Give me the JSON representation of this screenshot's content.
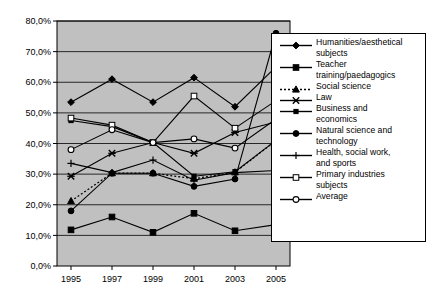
{
  "chart_data": {
    "type": "line",
    "title": "",
    "xlabel": "",
    "ylabel": "",
    "categories": [
      "1995",
      "1997",
      "1999",
      "2001",
      "2003",
      "2005"
    ],
    "x": [
      1995,
      1997,
      1999,
      2001,
      2003,
      2005
    ],
    "ylim": [
      0,
      80
    ],
    "ytick_values": [
      0,
      10,
      20,
      30,
      40,
      50,
      60,
      70,
      80
    ],
    "ytick_labels": [
      "0,0%",
      "10,0%",
      "20,0%",
      "30,0%",
      "40,0%",
      "50,0%",
      "60,0%",
      "70,0%",
      "80,0%"
    ],
    "xtick_labels": [
      "1995",
      "1997",
      "1999",
      "2001",
      "2003",
      "2005"
    ],
    "grid": "horizontal",
    "legend_position": "right",
    "plot_background": "#c0c0c0",
    "line_color": "#000000",
    "series": [
      {
        "name": "Humanities/aesthetical subjects",
        "marker": "diamond-filled",
        "dash": "solid",
        "values": [
          53.5,
          61.0,
          53.5,
          61.5,
          52.0,
          65.0
        ]
      },
      {
        "name": "Teacher training/paedagogics",
        "marker": "square-filled",
        "dash": "solid",
        "values": [
          11.8,
          16.0,
          11.0,
          17.2,
          11.5,
          13.5
        ]
      },
      {
        "name": "Social science",
        "marker": "triangle-filled",
        "dash": "dotted",
        "values": [
          21.2,
          30.3,
          30.3,
          28.5,
          30.6,
          41.0
        ]
      },
      {
        "name": "Law",
        "marker": "x-cross",
        "dash": "solid",
        "values": [
          29.3,
          36.8,
          40.3,
          36.8,
          43.6,
          47.0
        ]
      },
      {
        "name": "Business and economics",
        "marker": "square-small-filled",
        "dash": "solid",
        "values": [
          47.5,
          45.5,
          40.3,
          29.3,
          30.8,
          41.0
        ]
      },
      {
        "name": "Natural science and technology",
        "marker": "circle-filled",
        "dash": "solid",
        "values": [
          18.0,
          30.3,
          30.3,
          26.0,
          28.4,
          76.0
        ]
      },
      {
        "name": "Health, social work, and sports",
        "marker": "plus",
        "dash": "solid",
        "values": [
          33.5,
          30.5,
          34.6,
          28.0,
          30.5,
          31.2
        ]
      },
      {
        "name": "Primary industries subjects",
        "marker": "square-open",
        "dash": "solid",
        "values": [
          48.3,
          46.0,
          40.3,
          55.5,
          45.0,
          54.0
        ]
      },
      {
        "name": "Average",
        "marker": "circle-open",
        "dash": "solid",
        "values": [
          38.0,
          44.5,
          40.3,
          41.5,
          38.5,
          48.0
        ]
      }
    ]
  },
  "legend": {
    "entries": [
      {
        "label": "Humanities/aesthetical\nsubjects",
        "marker": "diamond-filled",
        "dash": "solid"
      },
      {
        "label": "Teacher\ntraining/paedagogics",
        "marker": "square-filled",
        "dash": "solid"
      },
      {
        "label": "Social science",
        "marker": "triangle-filled",
        "dash": "dotted"
      },
      {
        "label": "Law",
        "marker": "x-cross",
        "dash": "solid"
      },
      {
        "label": "Business and\neconomics",
        "marker": "square-small-filled",
        "dash": "solid"
      },
      {
        "label": "Natural science and\ntechnology",
        "marker": "circle-filled",
        "dash": "solid"
      },
      {
        "label": "Health, social work,\nand sports",
        "marker": "plus",
        "dash": "solid"
      },
      {
        "label": "Primary industries\nsubjects",
        "marker": "square-open",
        "dash": "solid"
      },
      {
        "label": "Average",
        "marker": "circle-open",
        "dash": "solid"
      }
    ]
  }
}
